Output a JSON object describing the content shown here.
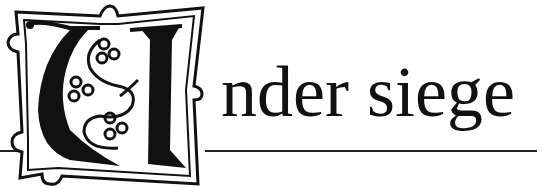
{
  "heading": {
    "initial_letter": "U",
    "rest": "nder siege",
    "full_text": "Under siege"
  },
  "colors": {
    "ink": "#111111",
    "background": "#ffffff"
  }
}
